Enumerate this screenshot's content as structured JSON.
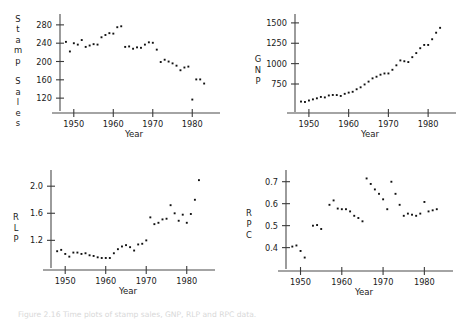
{
  "figure": {
    "caption": "Figure 2.16  Time plots of stamp sales, GNP, RLP and RPC data."
  },
  "chart_data": [
    {
      "id": "stamp-sales",
      "type": "scatter",
      "title": "",
      "xlabel": "Year",
      "ylabel": "Stamp Sales",
      "ylabel_stacked": [
        "S",
        "t",
        "a",
        "m",
        "p",
        "",
        "S",
        "a",
        "l",
        "e",
        "s"
      ],
      "xlim": [
        1946,
        1985
      ],
      "ylim": [
        105,
        295
      ],
      "xticks": [
        1950,
        1960,
        1970,
        1980
      ],
      "yticks": [
        120,
        160,
        200,
        240,
        280
      ],
      "grid": false,
      "legend": "none",
      "x": [
        1948,
        1949,
        1950,
        1951,
        1952,
        1953,
        1954,
        1955,
        1956,
        1957,
        1958,
        1959,
        1960,
        1961,
        1962,
        1963,
        1964,
        1965,
        1966,
        1967,
        1968,
        1969,
        1970,
        1971,
        1972,
        1973,
        1974,
        1975,
        1976,
        1977,
        1978,
        1979,
        1980,
        1981,
        1982,
        1983
      ],
      "y": [
        243,
        222,
        240,
        237,
        247,
        232,
        235,
        238,
        237,
        253,
        258,
        262,
        261,
        275,
        277,
        232,
        233,
        228,
        231,
        230,
        237,
        242,
        241,
        226,
        199,
        204,
        200,
        196,
        191,
        181,
        187,
        189,
        117,
        161,
        161,
        152
      ]
    },
    {
      "id": "gnp",
      "type": "scatter",
      "title": "",
      "xlabel": "Year",
      "ylabel": "GNP",
      "ylabel_stacked": [
        "G",
        "N",
        "P"
      ],
      "xlim": [
        1946,
        1985
      ],
      "ylim": [
        480,
        1560
      ],
      "xticks": [
        1950,
        1960,
        1970,
        1980
      ],
      "yticks": [
        750,
        1000,
        1250,
        1500
      ],
      "grid": false,
      "legend": "none",
      "x": [
        1948,
        1949,
        1950,
        1951,
        1952,
        1953,
        1954,
        1955,
        1956,
        1957,
        1958,
        1959,
        1960,
        1961,
        1962,
        1963,
        1964,
        1965,
        1966,
        1967,
        1968,
        1969,
        1970,
        1971,
        1972,
        1973,
        1974,
        1975,
        1976,
        1977,
        1978,
        1979,
        1980,
        1981,
        1982,
        1983
      ],
      "y": [
        535,
        530,
        548,
        562,
        575,
        592,
        586,
        610,
        616,
        615,
        604,
        630,
        645,
        655,
        686,
        710,
        745,
        780,
        820,
        840,
        865,
        880,
        880,
        925,
        980,
        1040,
        1030,
        1020,
        1080,
        1130,
        1190,
        1230,
        1230,
        1300,
        1380,
        1440,
        1475,
        1440
      ]
    },
    {
      "id": "rlp",
      "type": "scatter",
      "title": "",
      "xlabel": "Year",
      "ylabel": "RLP",
      "ylabel_stacked": [
        "R",
        "L",
        "P"
      ],
      "xlim": [
        1946,
        1985
      ],
      "ylim": [
        0.88,
        2.18
      ],
      "xticks": [
        1950,
        1960,
        1970,
        1980
      ],
      "yticks": [
        1.2,
        1.6,
        2.0
      ],
      "grid": false,
      "legend": "none",
      "x": [
        1948,
        1949,
        1950,
        1951,
        1952,
        1953,
        1954,
        1955,
        1956,
        1957,
        1958,
        1959,
        1960,
        1961,
        1962,
        1963,
        1964,
        1965,
        1966,
        1967,
        1968,
        1969,
        1970,
        1971,
        1972,
        1973,
        1974,
        1975,
        1976,
        1977,
        1978,
        1979,
        1980,
        1981,
        1982,
        1983
      ],
      "y": [
        1.04,
        1.06,
        1.0,
        0.96,
        1.02,
        1.02,
        1.0,
        1.01,
        0.98,
        0.97,
        0.95,
        0.94,
        0.94,
        0.94,
        1.01,
        1.07,
        1.11,
        1.13,
        1.1,
        1.05,
        1.14,
        1.15,
        1.2,
        1.54,
        1.44,
        1.46,
        1.51,
        1.52,
        1.72,
        1.6,
        1.49,
        1.58,
        1.46,
        1.59,
        1.8,
        2.09,
        1.99
      ]
    },
    {
      "id": "rpc",
      "type": "scatter",
      "title": "",
      "xlabel": "Year",
      "ylabel": "RPC",
      "ylabel_stacked": [
        "R",
        "P",
        "C"
      ],
      "xlim": [
        1946,
        1985
      ],
      "ylim": [
        0.33,
        0.735
      ],
      "xticks": [
        1950,
        1960,
        1970,
        1980
      ],
      "yticks": [
        0.4,
        0.5,
        0.6,
        0.7
      ],
      "grid": false,
      "legend": "none",
      "x": [
        1948,
        1949,
        1950,
        1951,
        1953,
        1954,
        1955,
        1957,
        1958,
        1959,
        1960,
        1961,
        1962,
        1963,
        1964,
        1965,
        1966,
        1967,
        1968,
        1969,
        1970,
        1971,
        1972,
        1973,
        1974,
        1975,
        1976,
        1977,
        1978,
        1979,
        1980,
        1981,
        1982,
        1983
      ],
      "y": [
        0.405,
        0.41,
        0.385,
        0.355,
        0.5,
        0.503,
        0.485,
        0.595,
        0.615,
        0.578,
        0.575,
        0.575,
        0.565,
        0.545,
        0.535,
        0.52,
        0.715,
        0.69,
        0.665,
        0.645,
        0.62,
        0.575,
        0.7,
        0.645,
        0.595,
        0.545,
        0.555,
        0.55,
        0.545,
        0.555,
        0.608,
        0.565,
        0.57,
        0.575,
        0.585,
        0.595,
        0.64,
        0.655
      ]
    }
  ]
}
